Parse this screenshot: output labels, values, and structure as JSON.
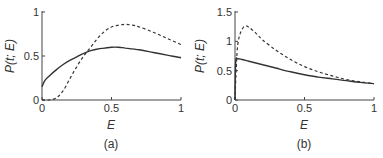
{
  "chart_data": [
    {
      "type": "line",
      "panel_label": "(a)",
      "xlabel": "E",
      "ylabel": "P(t; E)",
      "xlim": [
        0,
        1
      ],
      "ylim": [
        0,
        1
      ],
      "xticks": [
        "0",
        "0.5",
        "1"
      ],
      "yticks": [
        "0",
        "0.5",
        "1"
      ],
      "grid": false,
      "series": [
        {
          "name": "solid",
          "style": "solid",
          "x": [
            0,
            0.02,
            0.05,
            0.1,
            0.15,
            0.2,
            0.25,
            0.3,
            0.35,
            0.4,
            0.45,
            0.5,
            0.55,
            0.6,
            0.7,
            0.8,
            0.9,
            1.0
          ],
          "y": [
            0.15,
            0.22,
            0.27,
            0.34,
            0.4,
            0.45,
            0.49,
            0.53,
            0.56,
            0.58,
            0.59,
            0.6,
            0.6,
            0.59,
            0.57,
            0.54,
            0.51,
            0.48
          ]
        },
        {
          "name": "dashed",
          "style": "dashed",
          "x": [
            0,
            0.05,
            0.1,
            0.15,
            0.2,
            0.25,
            0.3,
            0.35,
            0.4,
            0.45,
            0.5,
            0.55,
            0.6,
            0.65,
            0.7,
            0.8,
            0.9,
            1.0
          ],
          "y": [
            0.0,
            0.0,
            0.02,
            0.1,
            0.24,
            0.38,
            0.5,
            0.6,
            0.7,
            0.78,
            0.83,
            0.85,
            0.86,
            0.85,
            0.83,
            0.77,
            0.7,
            0.63
          ]
        }
      ]
    },
    {
      "type": "line",
      "panel_label": "(b)",
      "xlabel": "E",
      "ylabel": "P(t; E)",
      "xlim": [
        0,
        1
      ],
      "ylim": [
        0,
        1.5
      ],
      "xticks": [
        "0",
        "0.5",
        "1"
      ],
      "yticks": [
        "0",
        "0.5",
        "1",
        "1.5"
      ],
      "grid": false,
      "series": [
        {
          "name": "solid",
          "style": "solid",
          "x": [
            0,
            0.005,
            0.02,
            0.05,
            0.1,
            0.2,
            0.3,
            0.4,
            0.5,
            0.6,
            0.7,
            0.8,
            0.9,
            1.0
          ],
          "y": [
            0.0,
            0.65,
            0.7,
            0.69,
            0.66,
            0.6,
            0.54,
            0.48,
            0.43,
            0.39,
            0.36,
            0.33,
            0.3,
            0.28
          ]
        },
        {
          "name": "dashed",
          "style": "dashed",
          "x": [
            0,
            0.01,
            0.02,
            0.04,
            0.07,
            0.1,
            0.15,
            0.2,
            0.3,
            0.4,
            0.5,
            0.6,
            0.7,
            0.8,
            0.9,
            1.0
          ],
          "y": [
            0.0,
            0.6,
            0.95,
            1.15,
            1.26,
            1.24,
            1.14,
            1.02,
            0.84,
            0.69,
            0.57,
            0.48,
            0.41,
            0.35,
            0.31,
            0.28
          ]
        }
      ]
    }
  ]
}
